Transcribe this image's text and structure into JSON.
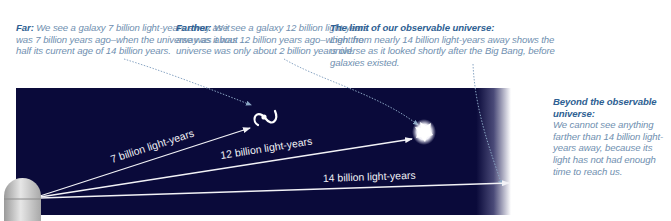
{
  "captions": {
    "far": {
      "lead": "Far:",
      "body": " We see a galaxy 7 billion light-years away as it was 7 billion years ago–when the universe was about half its current age of 14 billion years."
    },
    "farther": {
      "lead": "Farther:",
      "body": " We see a galaxy 12 billion light-years away as it was 12 billion years ago–when the universe was only about 2 billion years old."
    },
    "limit": {
      "lead": "The limit of our observable universe:",
      "body": "Light from nearly 14 billion light-years away shows the universe as it looked shortly after the Big Bang, before galaxies existed."
    },
    "beyond": {
      "lead": "Beyond the observable universe:",
      "body": "We cannot see anything farther than 14 billion light-years away, because its light has not had enough time to reach us."
    }
  },
  "rays": {
    "ray_7": {
      "label": "7 billion light-years",
      "distance_gly": 7
    },
    "ray_12": {
      "label": "12 billion light-years",
      "distance_gly": 12
    },
    "ray_14": {
      "label": "14 billion light-years",
      "distance_gly": 14
    }
  },
  "icons": {
    "observatory": "observatory-dome-icon",
    "spiral_galaxy": "spiral-galaxy-icon",
    "young_galaxy": "young-galaxy-blob-icon"
  },
  "colors": {
    "sky": "#0a0a3a",
    "caption_lead": "#2e5f93",
    "caption_body": "#6f8fb0",
    "ray": "#f2f2f6",
    "leader_line": "#8aa6c4"
  }
}
